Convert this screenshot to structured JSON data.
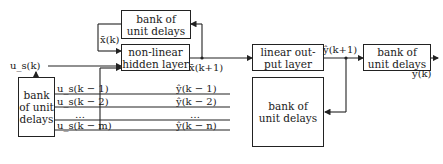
{
  "diagram": {
    "type": "block-diagram",
    "blocks": {
      "bank_top": "bank of unit delays",
      "hidden": "non-linear hidden layer",
      "output_layer": "linear out- put layer",
      "bank_right": "bank of unit delays",
      "bank_left": "bank of unit delays",
      "bank_bottom": "bank of unit delays"
    },
    "block_lines": {
      "bank_top": [
        "bank of",
        "unit delays"
      ],
      "hidden": [
        "non-linear",
        "hidden layer"
      ],
      "output_layer": [
        "linear out-",
        "put layer"
      ],
      "bank_right": [
        "bank of",
        "unit delays"
      ],
      "bank_left": [
        "bank",
        "of unit",
        "delays"
      ],
      "bank_bottom": [
        "bank of",
        "unit delays"
      ]
    },
    "signals": {
      "input": "u_s(k)",
      "state": "x̄(k)",
      "state_next": "x̄(k+1)",
      "output_next": "ŷ(k+1)",
      "output": "ŷ(k)",
      "u_delays": [
        "u_s(k − 1)",
        "u_s(k − 2)",
        "…",
        "u_s(k − m)"
      ],
      "y_delays": [
        "ŷ(k − 1)",
        "ŷ(k − 2)",
        "…",
        "ŷ(k − n)"
      ]
    }
  }
}
